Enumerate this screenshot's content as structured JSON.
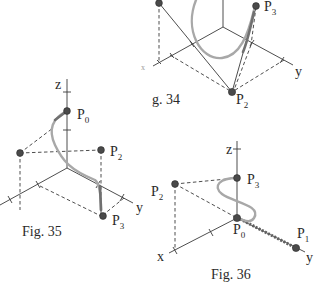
{
  "figures": [
    {
      "id": "fig34",
      "caption": "g. 34",
      "axis_labels": {
        "x": "x",
        "y": "y"
      },
      "points": [
        {
          "name": "P",
          "sub": "3"
        },
        {
          "name": "P",
          "sub": "2"
        }
      ]
    },
    {
      "id": "fig35",
      "caption": "Fig. 35",
      "axis_labels": {
        "z": "z",
        "y": "y"
      },
      "points": [
        {
          "name": "P",
          "sub": "0"
        },
        {
          "name": "P",
          "sub": "2"
        },
        {
          "name": "P",
          "sub": "3"
        }
      ]
    },
    {
      "id": "fig36",
      "caption": "Fig. 36",
      "axis_labels": {
        "z": "z",
        "x": "x",
        "y": "y"
      },
      "points": [
        {
          "name": "P",
          "sub": "2"
        },
        {
          "name": "P",
          "sub": "3"
        },
        {
          "name": "P",
          "sub": "0"
        },
        {
          "name": "P",
          "sub": "1"
        }
      ]
    }
  ],
  "colors": {
    "line": "#3a3a3a",
    "curve": "#a8a8a8",
    "point": "#4a4a4a",
    "background": "#ffffff"
  }
}
